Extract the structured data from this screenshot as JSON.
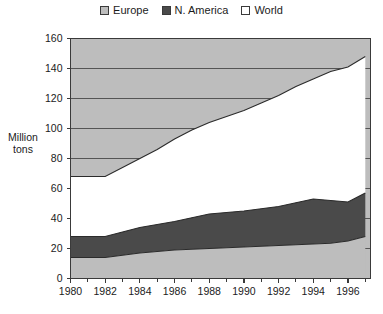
{
  "legend": {
    "entries": [
      {
        "label": "Europe",
        "color": "#bdbdbd",
        "icon": "legend-swatch-icon"
      },
      {
        "label": "N. America",
        "color": "#4a4a4a",
        "icon": "legend-swatch-icon"
      },
      {
        "label": "World",
        "color": "#ffffff",
        "icon": "legend-swatch-icon"
      }
    ]
  },
  "axis_title": {
    "line1": "Million",
    "line2": "tons"
  },
  "chart_data": {
    "type": "area",
    "title": "",
    "xlabel": "",
    "ylabel": "Million tons",
    "xlim": [
      1980,
      1997.3
    ],
    "ylim": [
      0,
      160
    ],
    "ytick_step": 20,
    "ytick_labels": [
      "0",
      "20",
      "40",
      "60",
      "80",
      "100",
      "120",
      "140",
      "160"
    ],
    "xtick_labels": [
      "1980",
      "1982",
      "1984",
      "1986",
      "1988",
      "1990",
      "1992",
      "1994",
      "1996"
    ],
    "xtick_values": [
      1980,
      1982,
      1984,
      1986,
      1988,
      1990,
      1992,
      1994,
      1996
    ],
    "xminor_values": [
      1981,
      1983,
      1985,
      1987,
      1989,
      1991,
      1993,
      1995,
      1997
    ],
    "grid": "horizontal-gridlines-inside-europe-region-only",
    "legend_position": "top-center",
    "x": [
      1980,
      1981,
      1982,
      1983,
      1984,
      1985,
      1986,
      1987,
      1988,
      1989,
      1990,
      1991,
      1992,
      1993,
      1994,
      1995,
      1996,
      1997
    ],
    "series": [
      {
        "name": "Europe",
        "color": "#bdbdbd",
        "region": "bottom-band",
        "values": [
          14,
          14,
          14,
          15.5,
          17,
          18,
          19,
          19.5,
          20,
          20.5,
          21,
          21.5,
          22,
          22.5,
          23,
          23.5,
          25,
          28
        ]
      },
      {
        "name": "N. America",
        "color": "#4a4a4a",
        "region": "middle-band-cumulative-top",
        "values": [
          28,
          28,
          28,
          31,
          34,
          36,
          38,
          40.5,
          43,
          44,
          45,
          46.5,
          48,
          50.5,
          53,
          52,
          51,
          57
        ]
      },
      {
        "name": "World",
        "color": "#ffffff",
        "region": "upper-band-cumulative-top",
        "values": [
          68,
          68,
          68,
          74,
          80,
          86,
          93,
          99,
          104,
          108,
          112,
          117,
          122,
          128,
          133,
          138,
          141,
          148
        ]
      }
    ]
  }
}
